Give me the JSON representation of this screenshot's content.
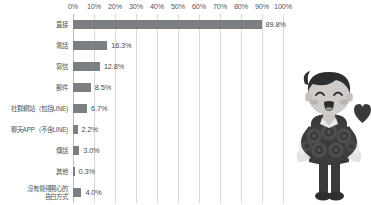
{
  "chart_data": {
    "type": "bar",
    "orientation": "horizontal",
    "title": "",
    "xlabel": "",
    "ylabel": "",
    "xlim": [
      0,
      100
    ],
    "grid": true,
    "legend": false,
    "unit": "%",
    "tick_labels": [
      "0%",
      "10%",
      "20%",
      "30%",
      "40%",
      "50%",
      "60%",
      "70%",
      "80%",
      "90%",
      "100%"
    ],
    "tick_values": [
      0,
      10,
      20,
      30,
      40,
      50,
      60,
      70,
      80,
      90,
      100
    ],
    "categories": [
      "直接",
      "電話",
      "寫信",
      "郵件",
      "社群網站（包括LINE)",
      "聊天APP（不含LINE)",
      "傳話",
      "其他",
      "沒有覺得開心的\n告白方式"
    ],
    "values": [
      89.8,
      16.3,
      12.8,
      8.5,
      6.7,
      2.2,
      3.0,
      0.3,
      4.0
    ],
    "data_labels": [
      "89.8%",
      "16.3%",
      "12.8%",
      "8.5%",
      "6.7%",
      "2.2%",
      "3.0%",
      "0.3%",
      "4.0%"
    ]
  },
  "colors": {
    "bar": "#7c7f82",
    "gridline": "#d8d9da",
    "axis": "#bdbec0",
    "tick_text": "#55585c",
    "label_text": "#4e5154",
    "value_text": "#4a4d50",
    "background": "#ffffff",
    "illustration_dark": "#3a3a3c",
    "illustration_mid": "#6f7073",
    "illustration_light": "#d2d3d5",
    "illustration_skin": "#c9c6c4"
  },
  "illustration": {
    "name": "boy-with-bouquet",
    "description": "cartoon boy in dark suit holding a bouquet of roses with a heart"
  }
}
